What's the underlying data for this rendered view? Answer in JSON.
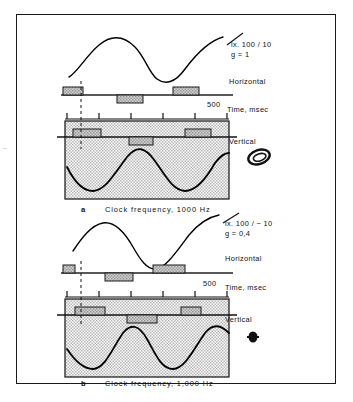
{
  "figure": {
    "background": "#ffffff",
    "frame_color": "#1a1a1a",
    "shade_color": "#c9c9c9",
    "bar_fill": "#b0b0b0",
    "trace_color": "#000000"
  },
  "panels": [
    {
      "id": "a",
      "letter": "a",
      "annotation_line1": "lx. 100 / 10",
      "annotation_line2": "g = 1",
      "label_horizontal": "Horizontal",
      "label_vertical": "Vertical",
      "axis_value": "500",
      "axis_unit": "Time, msec",
      "caption": "Clock frequency,  1000 Hz",
      "lissajous_icon": "ellipse-ring-icon",
      "horizontal_trace": {
        "type": "sine",
        "cycles": 1.25,
        "amplitude": 22,
        "phase_deg": 200
      },
      "vertical_trace": {
        "type": "sine",
        "cycles": 2,
        "amplitude": 27,
        "phase_deg": 180
      },
      "horizontal_bars": [
        {
          "x": 2,
          "width": 20,
          "side": "above"
        },
        {
          "x": 56,
          "width": 26,
          "side": "below"
        },
        {
          "x": 112,
          "width": 26,
          "side": "above"
        }
      ],
      "vertical_bars": [
        {
          "x": 8,
          "width": 28,
          "side": "above"
        },
        {
          "x": 64,
          "width": 24,
          "side": "below"
        },
        {
          "x": 120,
          "width": 26,
          "side": "above"
        }
      ],
      "tick_count": 6,
      "dashed_marker_x": 16
    },
    {
      "id": "b",
      "letter": "b",
      "annotation_line1": "lx. 100 / − 10",
      "annotation_line2": "g = 0,4",
      "label_horizontal": "Horizontal",
      "label_vertical": "Vertical",
      "axis_value": "500",
      "axis_unit": "Time, msec",
      "caption": "Clock frequency, 1,000 Hz",
      "lissajous_icon": "blob-dot-icon",
      "horizontal_trace": {
        "type": "sine",
        "cycles": 1.25,
        "amplitude": 22,
        "phase_deg": 200
      },
      "vertical_trace": {
        "type": "sine",
        "cycles": 2,
        "amplitude": 27,
        "phase_deg": 180
      },
      "horizontal_bars": [
        {
          "x": 2,
          "width": 12,
          "side": "above"
        },
        {
          "x": 44,
          "width": 28,
          "side": "below"
        },
        {
          "x": 92,
          "width": 32,
          "side": "above"
        }
      ],
      "vertical_bars": [
        {
          "x": 10,
          "width": 30,
          "side": "above"
        },
        {
          "x": 62,
          "width": 30,
          "side": "below"
        },
        {
          "x": 116,
          "width": 20,
          "side": "above"
        }
      ],
      "tick_count": 6,
      "dashed_marker_x": 16
    }
  ]
}
